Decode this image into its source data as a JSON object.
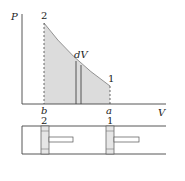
{
  "diagram": {
    "axes": {
      "y_label": "P",
      "x_label": "V"
    },
    "points": {
      "state_2": {
        "label": "2",
        "volume_label": "b"
      },
      "state_1": {
        "label": "1",
        "volume_label": "a"
      }
    },
    "strip_label": "dV",
    "cylinder": {
      "piston_left_label": "2",
      "piston_right_label": "1"
    },
    "colors": {
      "fill": "#dcdcdc",
      "line": "#333333"
    }
  }
}
